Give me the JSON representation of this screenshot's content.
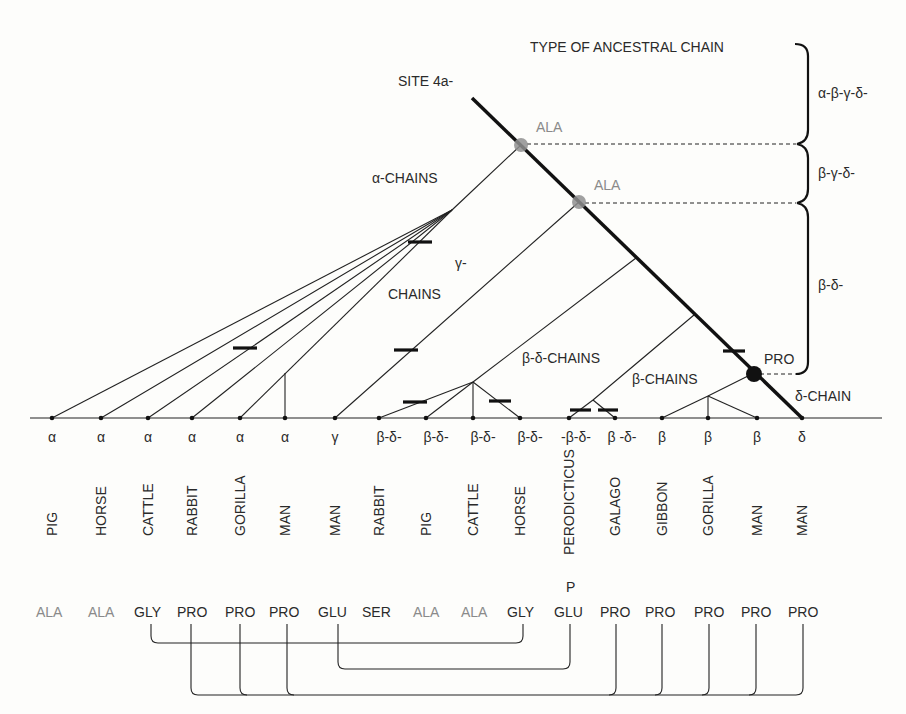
{
  "title": "TYPE OF ANCESTRAL CHAIN",
  "site_label": "SITE 4a-",
  "ancestral_types": [
    "α-β-γ-δ-",
    "β-γ-δ-",
    "β-δ-"
  ],
  "node_labels": {
    "ala1": "ALA",
    "ala2": "ALA",
    "pro": "PRO"
  },
  "clade_labels": {
    "alpha": "α-CHAINS",
    "gamma_1": "γ-",
    "gamma_2": "CHAINS",
    "beta_delta": "β-δ-CHAINS",
    "beta": "β-CHAINS",
    "delta": "δ-CHAIN"
  },
  "leaves": [
    {
      "chain": "α",
      "species": "PIG",
      "residue": "ALA",
      "residue_gray": true
    },
    {
      "chain": "α",
      "species": "HORSE",
      "residue": "ALA",
      "residue_gray": true
    },
    {
      "chain": "α",
      "species": "CATTLE",
      "residue": "GLY",
      "residue_gray": false
    },
    {
      "chain": "α",
      "species": "RABBIT",
      "residue": "PRO",
      "residue_gray": false
    },
    {
      "chain": "α",
      "species": "GORILLA",
      "residue": "PRO",
      "residue_gray": false
    },
    {
      "chain": "α",
      "species": "MAN",
      "residue": "PRO",
      "residue_gray": false
    },
    {
      "chain": "γ",
      "species": "MAN",
      "residue": "GLU",
      "residue_gray": false
    },
    {
      "chain": "β-δ-",
      "species": "RABBIT",
      "residue": "SER",
      "residue_gray": false
    },
    {
      "chain": "β-δ-",
      "species": "PIG",
      "residue": "ALA",
      "residue_gray": true
    },
    {
      "chain": "β-δ-",
      "species": "CATTLE",
      "residue": "ALA",
      "residue_gray": true
    },
    {
      "chain": "β-δ-",
      "species": "HORSE",
      "residue": "GLY",
      "residue_gray": false
    },
    {
      "chain": "-β-δ-",
      "species": "PERODICTICUS",
      "residue": "GLU",
      "residue_gray": false
    },
    {
      "chain": "β -δ-",
      "species": "GALAGO",
      "residue": "PRO",
      "residue_gray": false
    },
    {
      "chain": "β",
      "species": "GIBBON",
      "residue": "PRO",
      "residue_gray": false
    },
    {
      "chain": "β",
      "species": "GORILLA",
      "residue": "PRO",
      "residue_gray": false
    },
    {
      "chain": "β",
      "species": "MAN",
      "residue": "PRO",
      "residue_gray": false
    },
    {
      "chain": "δ",
      "species": "MAN",
      "residue": "PRO",
      "residue_gray": false
    }
  ],
  "glu_superscript": "P"
}
